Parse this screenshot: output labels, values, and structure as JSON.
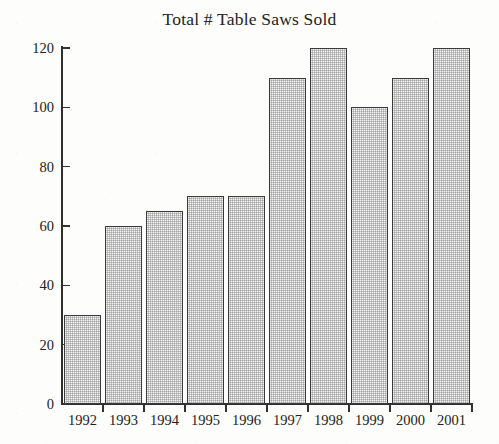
{
  "chart_data": {
    "type": "bar",
    "title": "Total # Table Saws Sold",
    "xlabel": "",
    "ylabel": "",
    "categories": [
      "1992",
      "1993",
      "1994",
      "1995",
      "1996",
      "1997",
      "1998",
      "1999",
      "2000",
      "2001"
    ],
    "values": [
      30,
      60,
      65,
      70,
      70,
      110,
      120,
      100,
      110,
      120
    ],
    "ylim": [
      0,
      120
    ],
    "ytick_labels": [
      "0",
      "20",
      "40",
      "60",
      "80",
      "100",
      "120"
    ],
    "ytick_values": [
      0,
      20,
      40,
      60,
      80,
      100,
      120
    ],
    "grid": false,
    "legend": "none",
    "bar_fill_color": "#f1f1f1",
    "bar_edge_color": "#3a3a3a",
    "axis_color": "#2e2e2e",
    "background_color": "#fdfdfb",
    "text_color": "#222222"
  }
}
